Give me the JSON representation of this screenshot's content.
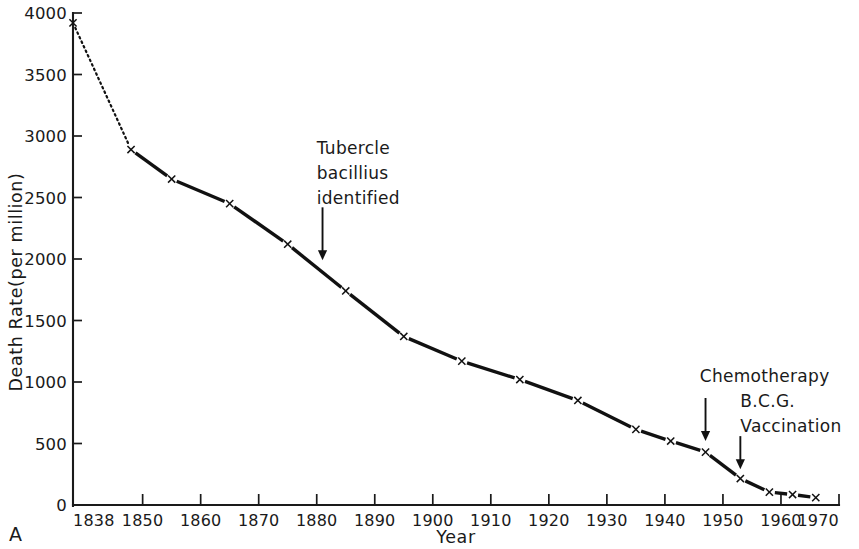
{
  "figure": {
    "panel_label": "A",
    "background_color": "#ffffff",
    "ink_color": "#111111"
  },
  "chart_data": {
    "type": "line",
    "title": "",
    "xlabel": "Year",
    "ylabel": "Death Rate(per million)",
    "xlim": [
      1838,
      1970
    ],
    "ylim": [
      0,
      4000
    ],
    "grid": false,
    "legend": "none",
    "marker": "x",
    "x_ticks": [
      1838,
      1850,
      1860,
      1870,
      1880,
      1890,
      1900,
      1910,
      1920,
      1930,
      1940,
      1950,
      1960,
      1970
    ],
    "x_tick_labels": [
      "1838",
      "1850",
      "1860",
      "1870",
      "1880",
      "1890",
      "1900",
      "1910",
      "1920",
      "1930",
      "1940",
      "1950",
      "1960",
      "1970"
    ],
    "y_ticks": [
      0,
      500,
      1000,
      1500,
      2000,
      2500,
      3000,
      3500,
      4000
    ],
    "y_tick_labels": [
      "0",
      "500",
      "1000",
      "1500",
      "2000",
      "2500",
      "3000",
      "3500",
      "4000"
    ],
    "series": [
      {
        "name": "Respiratory tuberculosis death rate",
        "x": [
          1838,
          1848,
          1855,
          1865,
          1875,
          1885,
          1895,
          1905,
          1915,
          1925,
          1935,
          1941,
          1947,
          1953,
          1958,
          1962,
          1966
        ],
        "values": [
          3920,
          2890,
          2650,
          2450,
          2120,
          1740,
          1370,
          1170,
          1020,
          850,
          615,
          520,
          430,
          215,
          105,
          85,
          60
        ],
        "segment_styles": [
          "dotted",
          "solid",
          "solid",
          "solid",
          "solid",
          "solid",
          "solid",
          "solid",
          "solid",
          "solid",
          "solid",
          "solid",
          "solid",
          "solid",
          "solid",
          "solid"
        ]
      }
    ],
    "annotations": [
      {
        "id": "tubercle-bacillius",
        "lines": [
          "Tubercle",
          "bacillius",
          "identified"
        ],
        "text_x": 1880,
        "text_y": 2850,
        "arrow_x": 1881,
        "arrow_top_y": 2420,
        "arrow_tip_y": 1990
      },
      {
        "id": "chemotherapy",
        "lines": [
          "Chemotherapy"
        ],
        "text_x": 1946,
        "text_y": 1000,
        "arrow_x": 1947,
        "arrow_top_y": 870,
        "arrow_tip_y": 520
      },
      {
        "id": "bcg-vaccination",
        "lines": [
          "B.C.G.",
          "Vaccination"
        ],
        "text_x": 1953,
        "text_y": 800,
        "arrow_x": 1953,
        "arrow_top_y": 560,
        "arrow_tip_y": 290
      }
    ]
  }
}
